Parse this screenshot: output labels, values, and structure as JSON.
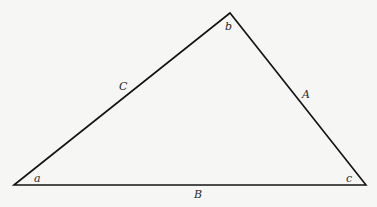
{
  "diagram": {
    "type": "triangle",
    "background": "#f6f6f4",
    "stroke_color": "#141414",
    "vertices": {
      "a": {
        "label": "a",
        "x": 14,
        "y": 185
      },
      "b": {
        "label": "b",
        "x": 230,
        "y": 13
      },
      "c": {
        "label": "c",
        "x": 366,
        "y": 185
      }
    },
    "angle_labels": [
      {
        "id": "a",
        "text": "a",
        "x": 34,
        "y": 182
      },
      {
        "id": "b",
        "text": "b",
        "x": 225,
        "y": 30
      },
      {
        "id": "c",
        "text": "c",
        "x": 346,
        "y": 182
      }
    ],
    "side_labels": [
      {
        "id": "C",
        "text": "C",
        "x": 119,
        "y": 90,
        "between": [
          "a",
          "b"
        ]
      },
      {
        "id": "A",
        "text": "A",
        "x": 302,
        "y": 98,
        "between": [
          "b",
          "c"
        ]
      },
      {
        "id": "B",
        "text": "B",
        "x": 194,
        "y": 198,
        "between": [
          "a",
          "c"
        ]
      }
    ]
  }
}
